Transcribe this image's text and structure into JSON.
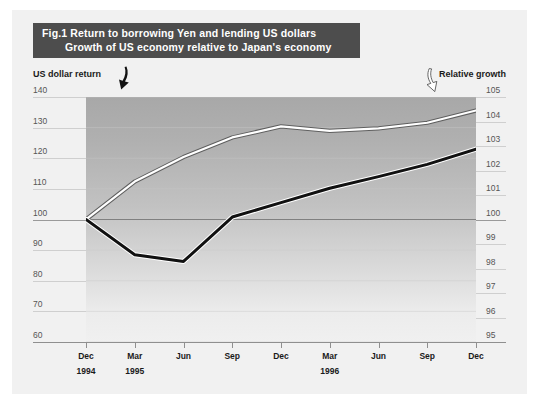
{
  "banner": {
    "line1": "Fig.1 Return to borrowing Yen and lending US dollars",
    "line2": "Growth of US economy relative to Japan's economy"
  },
  "captions": {
    "left": "US dollar return",
    "right": "Relative growth",
    "left_arrow_icon": "arrow-black-down-left-icon",
    "right_arrow_icon": "arrow-white-down-right-icon"
  },
  "colors": {
    "banner_bg": "#4d4d4d",
    "banner_text": "#ffffff",
    "paper_bg": "#f1f1f1",
    "plot_top": "#a8a8a8",
    "plot_bottom": "#f0f0f0",
    "series_black": "#111111",
    "series_white": "#ffffff",
    "grid": "#cfcfcf",
    "axis": "#8f8f8f"
  },
  "chart_data": {
    "type": "line",
    "xlabel": "",
    "ylabel": "US dollar return",
    "y2label": "Relative growth",
    "grid": true,
    "legend": "inline-arrow-annotations",
    "x": [
      "Dec 1994",
      "Mar 1995",
      "Jun 1995",
      "Sep 1995",
      "Dec 1995",
      "Mar 1996",
      "Jun 1996",
      "Sep 1996",
      "Dec 1996"
    ],
    "x_months": [
      "Dec",
      "Mar",
      "Jun",
      "Sep",
      "Dec",
      "Mar",
      "Jun",
      "Sep",
      "Dec"
    ],
    "x_years": [
      {
        "label": "1994",
        "at_index": 0
      },
      {
        "label": "1995",
        "at_index": 1
      },
      {
        "label": "1996",
        "at_index": 5
      }
    ],
    "ylim": [
      60,
      140
    ],
    "yticks": [
      140,
      130,
      120,
      110,
      100,
      90,
      80,
      70,
      60
    ],
    "y2lim": [
      95,
      105
    ],
    "y2ticks": [
      105,
      104,
      103,
      102,
      101,
      100,
      99,
      98,
      97,
      96,
      95
    ],
    "series": [
      {
        "name": "US dollar return",
        "axis": "left",
        "style": "black-solid",
        "color": "#111111",
        "values": [
          100.0,
          88.5,
          86.3,
          100.8,
          105.5,
          110.2,
          114.0,
          118.0,
          123.0
        ]
      },
      {
        "name": "Relative growth",
        "axis": "right",
        "style": "white-outlined",
        "color": "#ffffff",
        "values": [
          100.0,
          101.55,
          102.55,
          103.35,
          103.8,
          103.62,
          103.72,
          103.95,
          104.45
        ]
      }
    ]
  }
}
